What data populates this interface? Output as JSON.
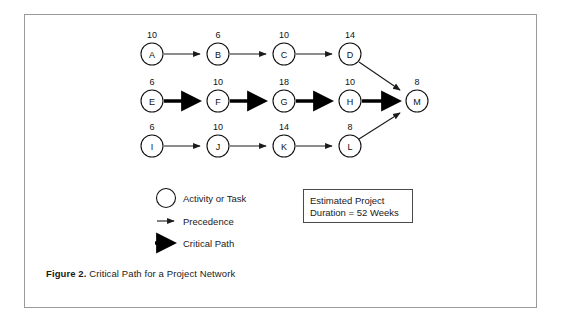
{
  "figure": {
    "caption_label": "Figure 2.",
    "caption_text": " Critical Path for a Project Network",
    "border_color": "#9a9a9a"
  },
  "diagram": {
    "type": "activity-on-node-project-network",
    "node_radius": 11,
    "rows": [
      {
        "row_name": "top-row",
        "y": 54,
        "nodes": [
          {
            "id": "A",
            "label": "A",
            "duration": "10",
            "x": 152
          },
          {
            "id": "B",
            "label": "B",
            "duration": "6",
            "x": 218
          },
          {
            "id": "C",
            "label": "C",
            "duration": "10",
            "x": 284
          },
          {
            "id": "D",
            "label": "D",
            "duration": "14",
            "x": 350
          }
        ]
      },
      {
        "row_name": "middle-row",
        "y": 101,
        "nodes": [
          {
            "id": "E",
            "label": "E",
            "duration": "6",
            "x": 152
          },
          {
            "id": "F",
            "label": "F",
            "duration": "10",
            "x": 218
          },
          {
            "id": "G",
            "label": "G",
            "duration": "18",
            "x": 284
          },
          {
            "id": "H",
            "label": "H",
            "duration": "10",
            "x": 350
          },
          {
            "id": "M",
            "label": "M",
            "duration": "8",
            "x": 417
          }
        ]
      },
      {
        "row_name": "bottom-row",
        "y": 146,
        "nodes": [
          {
            "id": "I",
            "label": "I",
            "duration": "6",
            "x": 152
          },
          {
            "id": "J",
            "label": "J",
            "duration": "10",
            "x": 218
          },
          {
            "id": "K",
            "label": "K",
            "duration": "14",
            "x": 284
          },
          {
            "id": "L",
            "label": "L",
            "duration": "8",
            "x": 350
          }
        ]
      }
    ],
    "edges": [
      {
        "from": "A",
        "to": "B",
        "kind": "precedence"
      },
      {
        "from": "B",
        "to": "C",
        "kind": "precedence"
      },
      {
        "from": "C",
        "to": "D",
        "kind": "precedence"
      },
      {
        "from": "D",
        "to": "M",
        "kind": "precedence"
      },
      {
        "from": "E",
        "to": "F",
        "kind": "critical"
      },
      {
        "from": "F",
        "to": "G",
        "kind": "critical"
      },
      {
        "from": "G",
        "to": "H",
        "kind": "critical"
      },
      {
        "from": "H",
        "to": "M",
        "kind": "critical"
      },
      {
        "from": "I",
        "to": "J",
        "kind": "precedence"
      },
      {
        "from": "J",
        "to": "K",
        "kind": "precedence"
      },
      {
        "from": "K",
        "to": "L",
        "kind": "precedence"
      },
      {
        "from": "L",
        "to": "M",
        "kind": "precedence"
      }
    ],
    "critical_path": "E-F-G-H-M"
  },
  "legend": {
    "items": [
      {
        "symbol": "circle",
        "label": "Activity or Task"
      },
      {
        "symbol": "thin-arrow",
        "label": "Precedence"
      },
      {
        "symbol": "bold-arrow",
        "label": "Critical Path"
      }
    ]
  },
  "estimate": {
    "line1": "Estimated Project",
    "line2": "Duration = 52 Weeks"
  }
}
